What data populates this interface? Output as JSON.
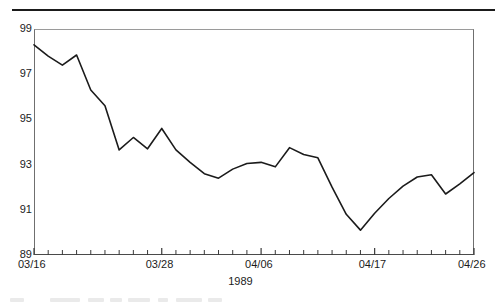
{
  "figure": {
    "has_top_rule": true,
    "background_color": "#ffffff",
    "line_color": "#1b1b1b",
    "axis_color": "#4a4a4a"
  },
  "chart_data": {
    "type": "line",
    "title": "",
    "subtitle": "",
    "xlabel": "1989",
    "ylabel": "",
    "ylim": [
      89,
      99
    ],
    "xlim": [
      0,
      30
    ],
    "grid": false,
    "legend": null,
    "y_ticks": [
      99,
      97,
      95,
      93,
      91,
      89
    ],
    "y_tick_labels": [
      "99",
      "97",
      "95",
      "93",
      "91",
      "89"
    ],
    "x_tick_labels": [
      "03/16",
      "03/28",
      "04/06",
      "04/17",
      "04/26"
    ],
    "x_tick_label_indices": [
      0,
      9,
      16,
      24,
      31
    ],
    "x_minor_tick_count": 32,
    "x": [
      0,
      1,
      2,
      3,
      4,
      5,
      6,
      7,
      8,
      9,
      10,
      11,
      12,
      13,
      14,
      15,
      16,
      17,
      18,
      19,
      20,
      21,
      22,
      23,
      24,
      25,
      26,
      27,
      28,
      29,
      30,
      31
    ],
    "categories": [
      "03/16",
      "03/17",
      "03/18",
      "03/19",
      "03/20",
      "03/21",
      "03/22",
      "03/23",
      "03/24",
      "03/28",
      "03/29",
      "03/30",
      "03/31",
      "04/03",
      "04/04",
      "04/05",
      "04/06",
      "04/07",
      "04/10",
      "04/11",
      "04/12",
      "04/13",
      "04/14",
      "04/16",
      "04/17",
      "04/18",
      "04/19",
      "04/20",
      "04/21",
      "04/24",
      "04/25",
      "04/26"
    ],
    "values": [
      98.3,
      97.8,
      97.4,
      97.85,
      96.3,
      95.6,
      93.65,
      94.2,
      93.7,
      94.6,
      93.65,
      93.1,
      92.6,
      92.4,
      92.8,
      93.05,
      93.1,
      92.9,
      93.75,
      93.45,
      93.3,
      92.0,
      90.8,
      90.1,
      90.85,
      91.5,
      92.05,
      92.45,
      92.55,
      91.7,
      92.15,
      92.65
    ],
    "series": [
      {
        "name": "index",
        "values": [
          98.3,
          97.8,
          97.4,
          97.85,
          96.3,
          95.6,
          93.65,
          94.2,
          93.7,
          94.6,
          93.65,
          93.1,
          92.6,
          92.4,
          92.8,
          93.05,
          93.1,
          92.9,
          93.75,
          93.45,
          93.3,
          92.0,
          90.8,
          90.1,
          90.85,
          91.5,
          92.05,
          92.45,
          92.55,
          91.7,
          92.15,
          92.65
        ],
        "color": "#1b1b1b"
      }
    ]
  }
}
